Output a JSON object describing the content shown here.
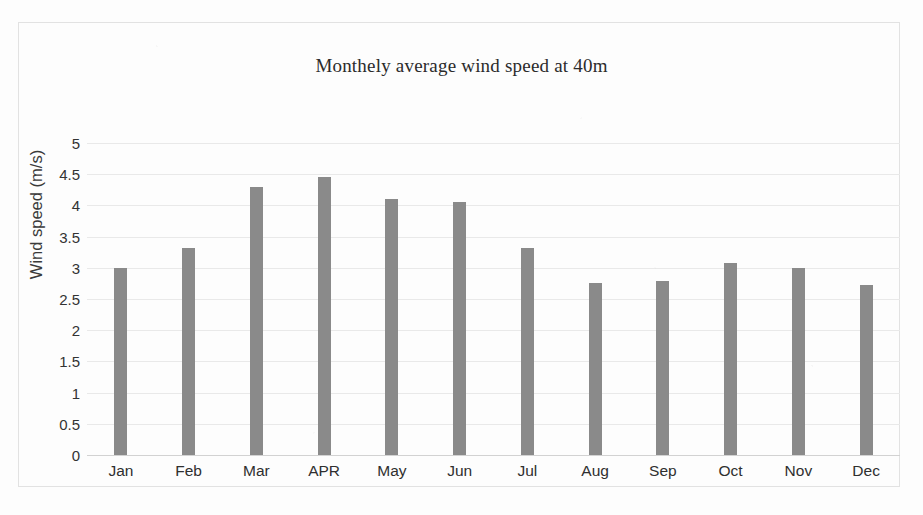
{
  "chart_data": {
    "type": "bar",
    "title": "Monthely average wind speed at 40m",
    "xlabel": "",
    "ylabel": "Wind speed (m/s)",
    "categories": [
      "Jan",
      "Feb",
      "Mar",
      "APR",
      "May",
      "Jun",
      "Jul",
      "Aug",
      "Sep",
      "Oct",
      "Nov",
      "Dec"
    ],
    "values": [
      3.0,
      3.32,
      4.3,
      4.45,
      4.1,
      4.05,
      3.32,
      2.76,
      2.79,
      3.08,
      3.0,
      2.72
    ],
    "ylim": [
      0,
      5
    ],
    "ytick_step": 0.5,
    "ytick_labels": [
      "5",
      "4.5",
      "4",
      "3.5",
      "3",
      "2.5",
      "2",
      "1.5",
      "1",
      "0.5",
      "0"
    ],
    "grid": true,
    "legend": false,
    "legend_position": "none",
    "bar_color": "#8a8a8a",
    "gridline_color": "#e9e9e9",
    "frame_color": "#e2e2e2",
    "background_color": "#fdfdfd"
  }
}
